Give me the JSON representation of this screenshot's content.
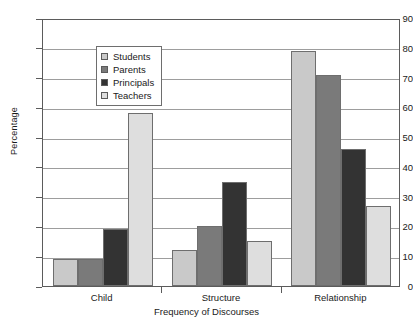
{
  "chart_data": {
    "type": "bar",
    "title": "",
    "xlabel": "Frequency of Discourses",
    "ylabel": "Percentage",
    "categories": [
      "Child",
      "Structure",
      "Relationship"
    ],
    "series": [
      {
        "name": "Students",
        "color": "#c9c9c9",
        "values": [
          9,
          12,
          79
        ]
      },
      {
        "name": "Parents",
        "color": "#7a7a7a",
        "values": [
          9,
          20,
          71
        ]
      },
      {
        "name": "Principals",
        "color": "#333333",
        "values": [
          19,
          35,
          46
        ]
      },
      {
        "name": "Teachers",
        "color": "#dedede",
        "values": [
          58,
          15,
          27
        ]
      }
    ],
    "ylim": [
      0,
      90
    ],
    "yticks": [
      0,
      10,
      20,
      30,
      40,
      50,
      60,
      70,
      80,
      90
    ],
    "ytick_labels": [
      "0",
      "10",
      "20",
      "30",
      "40",
      "50",
      "60",
      "70",
      "80",
      "90"
    ],
    "grid": true,
    "legend_position": "upper left",
    "legend_entries": [
      "Students",
      "Parents",
      "Principals",
      "Teachers"
    ]
  },
  "axes": {
    "y_title": "Percentage",
    "x_title": "Frequency of Discourses"
  }
}
